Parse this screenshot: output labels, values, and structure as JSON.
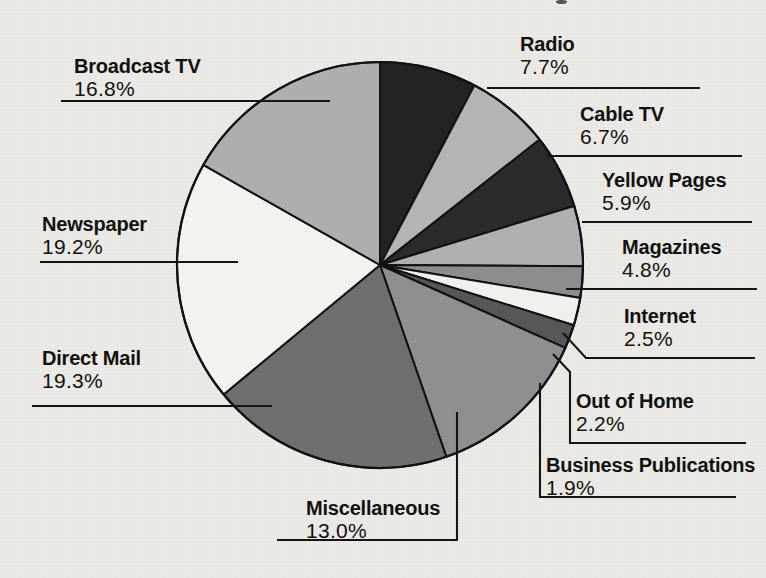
{
  "chart_data": {
    "type": "pie",
    "title": "",
    "xlabel": "",
    "ylabel": "",
    "unit": "percent",
    "total": 100.0,
    "start_angle_deg": 0,
    "direction": "clockwise",
    "legend_position": "callout-labels",
    "grid": false,
    "categories": [
      "Radio",
      "Cable TV",
      "Yellow Pages",
      "Magazines",
      "Internet",
      "Out of Home",
      "Business Publications",
      "Miscellaneous",
      "Direct Mail",
      "Newspaper",
      "Broadcast TV"
    ],
    "values": [
      7.7,
      6.7,
      5.9,
      4.8,
      2.5,
      2.2,
      1.9,
      13.0,
      19.3,
      19.2,
      16.8
    ],
    "slice_colors": [
      "#232323",
      "#b4b4b4",
      "#2b2b2b",
      "#b0b0b0",
      "#8d8d8d",
      "#f2f0ec",
      "#575757",
      "#8f8f8f",
      "#6f6f6f",
      "#f4f2ee",
      "#aeaeae"
    ],
    "slice_stroke": "#121212"
  },
  "slices": [
    {
      "name": "Radio",
      "pct_label": "7.7%",
      "value": 7.7
    },
    {
      "name": "Cable TV",
      "pct_label": "6.7%",
      "value": 6.7
    },
    {
      "name": "Yellow Pages",
      "pct_label": "5.9%",
      "value": 5.9
    },
    {
      "name": "Magazines",
      "pct_label": "4.8%",
      "value": 4.8
    },
    {
      "name": "Internet",
      "pct_label": "2.5%",
      "value": 2.5
    },
    {
      "name": "Out of Home",
      "pct_label": "2.2%",
      "value": 2.2
    },
    {
      "name": "Business Publications",
      "pct_label": "1.9%",
      "value": 1.9
    },
    {
      "name": "Miscellaneous",
      "pct_label": "13.0%",
      "value": 13.0
    },
    {
      "name": "Direct Mail",
      "pct_label": "19.3%",
      "value": 19.3
    },
    {
      "name": "Newspaper",
      "pct_label": "19.2%",
      "value": 19.2
    },
    {
      "name": "Broadcast TV",
      "pct_label": "16.8%",
      "value": 16.8
    }
  ],
  "colors": {
    "background": "#eceae6",
    "ink": "#111111",
    "leader_line": "#151515"
  }
}
